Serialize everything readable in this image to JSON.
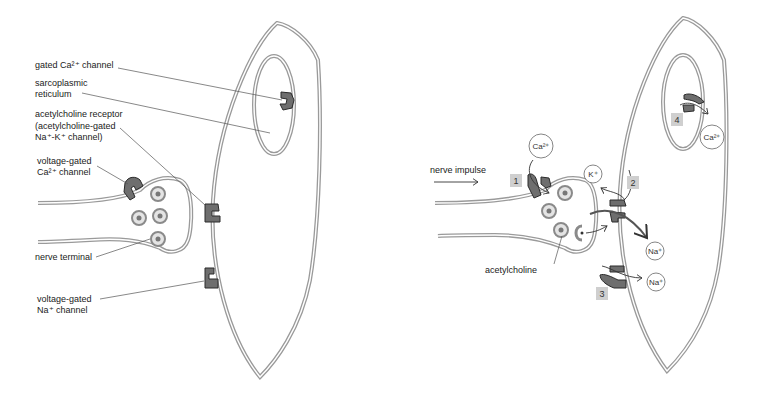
{
  "left_panel": {
    "labels": {
      "gated_ca_channel": "gated Ca²⁺ channel",
      "sarcoplasmic_1": "sarcoplasmic",
      "sarcoplasmic_2": "reticulum",
      "ach_receptor_1": "acetylcholine receptor",
      "ach_receptor_2": "(acetylcholine-gated",
      "ach_receptor_3": "Na⁺-K⁺ channel)",
      "vg_ca_1": "voltage-gated",
      "vg_ca_2": "Ca²⁺ channel",
      "nerve_terminal": "nerve terminal",
      "vg_na_1": "voltage-gated",
      "vg_na_2": "Na⁺ channel"
    }
  },
  "right_panel": {
    "nerve_impulse": "nerve impulse",
    "acetylcholine": "acetylcholine",
    "ions": {
      "ca_top": "Ca²⁺",
      "k": "K⁺",
      "na_1": "Na⁺",
      "na_2": "Na⁺",
      "ca_sr": "Ca²⁺"
    },
    "steps": [
      "1",
      "2",
      "3",
      "4"
    ]
  },
  "colors": {
    "membrane": "#9a9a9a",
    "channel_fill": "#6e6e6e",
    "channel_stroke": "#2a2a2a",
    "step_box": "#cfcfcf",
    "leader_line": "#555555"
  }
}
